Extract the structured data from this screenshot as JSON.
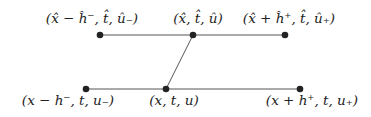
{
  "diagram": {
    "colors": {
      "line": "#555555",
      "node": "#222222",
      "text": "#222222",
      "background": "#ffffff"
    },
    "nodes": [
      {
        "id": "top_left",
        "x": 100,
        "y": 35,
        "label": "(x̂ − ĥ⁻, t̂, û₋)"
      },
      {
        "id": "top_mid",
        "x": 193,
        "y": 35,
        "label": "(x̂, t̂, û)"
      },
      {
        "id": "top_right",
        "x": 285,
        "y": 35,
        "label": "(x̂ + ĥ⁺, t̂, û₊)"
      },
      {
        "id": "bot_left",
        "x": 86,
        "y": 89,
        "label": "(x − h⁻, t, u₋)"
      },
      {
        "id": "bot_mid",
        "x": 166,
        "y": 89,
        "label": "(x, t, u)"
      },
      {
        "id": "bot_right",
        "x": 300,
        "y": 89,
        "label": "(x + h⁺, t, u₊)"
      }
    ],
    "edges": [
      {
        "from": "top_left",
        "to": "top_right"
      },
      {
        "from": "bot_left",
        "to": "bot_right"
      },
      {
        "from": "top_mid",
        "to": "bot_mid"
      }
    ]
  }
}
